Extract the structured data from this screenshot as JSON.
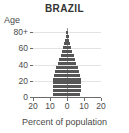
{
  "chart_data": {
    "type": "bar",
    "subtype": "population-pyramid",
    "title": "BRAZIL",
    "xlabel": "Percent of population",
    "ylabel": "Age",
    "xlim": [
      -20,
      20
    ],
    "ylim": [
      0,
      85
    ],
    "grid": true,
    "legend": null,
    "x_ticks": [
      -20,
      -10,
      0,
      10,
      20
    ],
    "x_tick_labels": [
      "20",
      "10",
      "0",
      "10",
      "20"
    ],
    "y_ticks": [
      0,
      20,
      40,
      60,
      80
    ],
    "y_tick_labels": [
      "0",
      "20",
      "40",
      "60",
      "80+"
    ],
    "bar_color": "#565656",
    "grid_color": "#e3e3e3",
    "axis_color": "#6b6b6b",
    "age_groups": [
      "0-4",
      "5-9",
      "10-14",
      "15-19",
      "20-24",
      "25-29",
      "30-34",
      "35-39",
      "40-44",
      "45-49",
      "50-54",
      "55-59",
      "60-64",
      "65-69",
      "70-74",
      "75-79",
      "80+"
    ],
    "series": [
      {
        "name": "Male",
        "side": "left",
        "values": [
          8.0,
          8.2,
          8.3,
          8.4,
          8.3,
          7.8,
          7.0,
          6.2,
          5.4,
          4.6,
          3.8,
          3.0,
          2.3,
          1.7,
          1.2,
          0.8,
          0.5
        ]
      },
      {
        "name": "Female",
        "side": "right",
        "values": [
          7.8,
          8.0,
          8.1,
          8.2,
          8.1,
          7.7,
          7.0,
          6.2,
          5.5,
          4.7,
          3.9,
          3.1,
          2.4,
          1.8,
          1.3,
          0.9,
          0.6
        ]
      }
    ]
  },
  "figure": {
    "title": "BRAZIL",
    "ylabel": "Age",
    "xlabel": "Percent of population",
    "y_tick_labels": [
      "80+",
      "60",
      "40",
      "20",
      "0"
    ],
    "x_tick_labels": [
      "20",
      "10",
      "0",
      "10",
      "20"
    ]
  }
}
